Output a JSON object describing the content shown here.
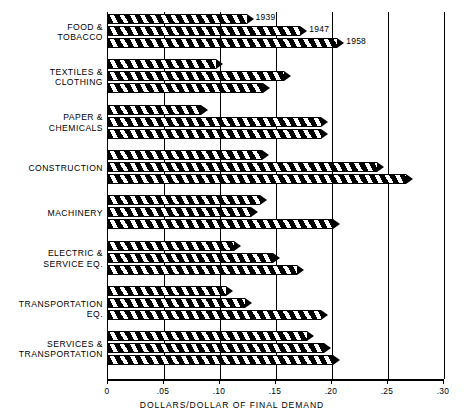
{
  "chart_data": {
    "type": "bar",
    "orientation": "horizontal",
    "title": "",
    "xlabel": "DOLLARS/DOLLAR OF FINAL DEMAND",
    "ylabel": "",
    "xlim": [
      0,
      0.3
    ],
    "xticks": [
      0,
      0.05,
      0.1,
      0.15,
      0.2,
      0.25,
      0.3
    ],
    "xticklabels": [
      "0",
      ".05",
      ".10",
      ".15",
      ".20",
      ".25",
      ".30"
    ],
    "grid": true,
    "grid_axis": "x",
    "legend": "inline-end-of-bar (first group only)",
    "categories": [
      "FOOD & TOBACCO",
      "TEXTILES & CLOTHING",
      "PAPER & CHEMICALS",
      "CONSTRUCTION",
      "MACHINERY",
      "ELECTRIC & SERVICE EQ.",
      "TRANSPORTATION EQ.",
      "SERVICES & TRANSPORTATION"
    ],
    "category_lines": [
      [
        "FOOD &",
        "TOBACCO"
      ],
      [
        "TEXTILES &",
        "CLOTHING"
      ],
      [
        "PAPER &",
        "CHEMICALS"
      ],
      [
        "CONSTRUCTION"
      ],
      [
        "MACHINERY"
      ],
      [
        "ELECTRIC &",
        "SERVICE EQ."
      ],
      [
        "TRANSPORTATION EQ."
      ],
      [
        "SERVICES &",
        "TRANSPORTATION"
      ]
    ],
    "series": [
      {
        "name": "1939",
        "values": [
          0.13,
          0.103,
          0.089,
          0.144,
          0.142,
          0.119,
          0.112,
          0.184
        ]
      },
      {
        "name": "1947",
        "values": [
          0.178,
          0.163,
          0.196,
          0.246,
          0.134,
          0.154,
          0.129,
          0.199
        ]
      },
      {
        "name": "1958",
        "values": [
          0.211,
          0.145,
          0.196,
          0.272,
          0.207,
          0.175,
          0.196,
          0.207
        ]
      }
    ],
    "series_labels_shown_on": "FOOD & TOBACCO"
  },
  "colors": {
    "background": "#ffffff",
    "foreground": "#000000",
    "bar_fill": "#000000",
    "gridline": "#000000"
  }
}
